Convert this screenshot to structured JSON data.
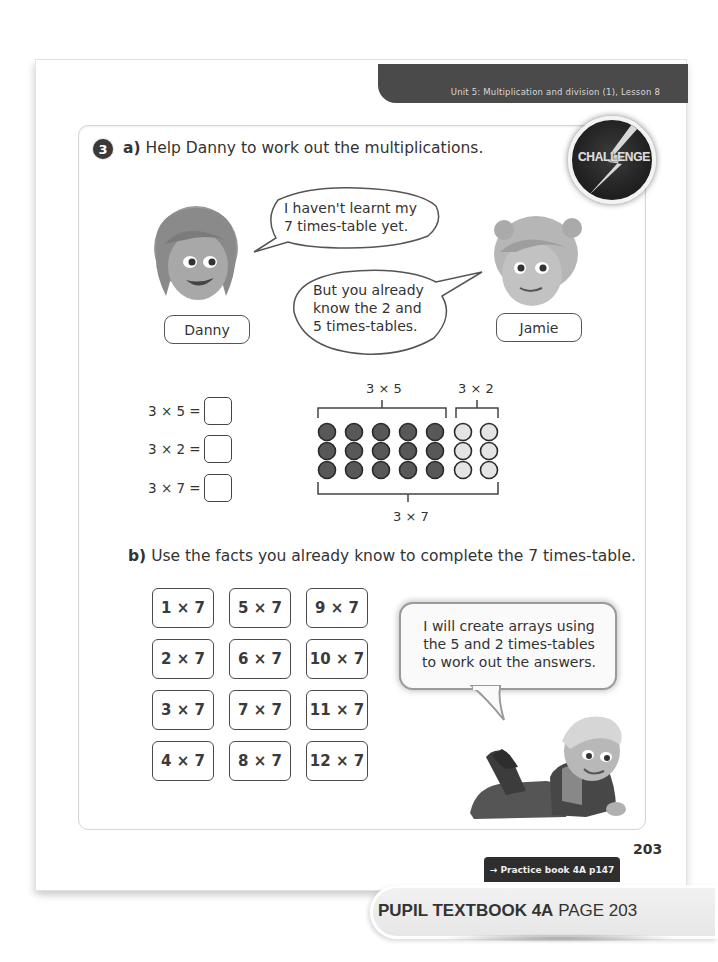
{
  "header": {
    "lesson": "Unit 5: Multiplication and division (1), Lesson 8"
  },
  "question": {
    "number": "3",
    "part_a": {
      "letter": "a)",
      "instruction": "Help Danny to work out the multiplications."
    },
    "badge": "CHALLENGE",
    "characters": [
      {
        "name": "Danny",
        "speech": [
          "I haven't learnt my",
          "7 times-table yet."
        ]
      },
      {
        "name": "Jamie",
        "speech": [
          "But you already",
          "know the 2 and",
          "5 times-tables."
        ]
      }
    ],
    "equations": [
      {
        "label": "3 × 5 =",
        "answer": ""
      },
      {
        "label": "3 × 2 =",
        "answer": ""
      },
      {
        "label": "3 × 7 =",
        "answer": ""
      }
    ],
    "array": {
      "rows": 3,
      "dark_cols": 5,
      "light_cols": 2,
      "label_left_group": "3 × 5",
      "label_right_group": "3 × 2",
      "label_total": "3 × 7",
      "dark_color": "#585858",
      "light_color": "#e4e4e4"
    },
    "part_b": {
      "letter": "b)",
      "instruction": "Use the facts you already know to complete the 7 times-table."
    },
    "fact_cards": [
      [
        "1 × 7",
        "5 × 7",
        "9 × 7"
      ],
      [
        "2 × 7",
        "6 × 7",
        "10 × 7"
      ],
      [
        "3 × 7",
        "7 × 7",
        "11 × 7"
      ],
      [
        "4 × 7",
        "8 × 7",
        "12 × 7"
      ]
    ],
    "helper_speech": [
      "I will create arrays using",
      "the 5 and 2 times-tables",
      "to work out the answers."
    ]
  },
  "footer": {
    "page_number": "203",
    "practice_link": "→ Practice book 4A p147",
    "book_title": "PUPIL TEXTBOOK 4A",
    "book_page": "PAGE 203"
  }
}
